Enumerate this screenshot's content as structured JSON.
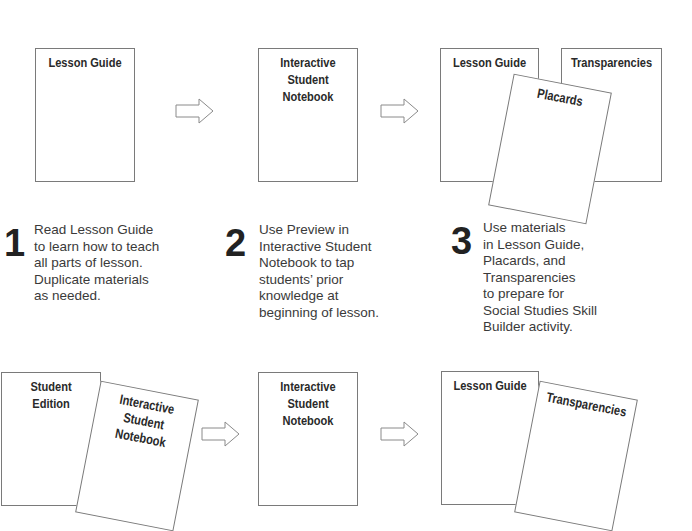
{
  "steps": [
    {
      "number": "1",
      "cards": [
        {
          "title": "Lesson Guide"
        }
      ],
      "text": "Read Lesson Guide\nto learn how to teach\nall parts of lesson.\nDuplicate materials\nas needed."
    },
    {
      "number": "2",
      "cards": [
        {
          "title": "Interactive\nStudent\nNotebook"
        }
      ],
      "text": "Use Preview in\nInteractive Student\nNotebook to tap\nstudents’ prior\nknowledge at\nbeginning of lesson."
    },
    {
      "number": "3",
      "cards": [
        {
          "title": "Lesson Guide"
        },
        {
          "title": "Transparencies"
        },
        {
          "title": "Placards"
        }
      ],
      "text": "Use materials\nin Lesson Guide,\nPlacards, and\nTransparencies\nto prepare for\nSocial Studies Skill\nBuilder activity."
    },
    {
      "cards": [
        {
          "title": "Student\nEdition"
        },
        {
          "title": "Interactive\nStudent\nNotebook"
        }
      ]
    },
    {
      "cards": [
        {
          "title": "Interactive\nStudent\nNotebook"
        }
      ]
    },
    {
      "cards": [
        {
          "title": "Lesson Guide"
        },
        {
          "title": "Transparencies"
        }
      ]
    }
  ],
  "arrows": [
    {
      "from": 1,
      "to": 2
    },
    {
      "from": 2,
      "to": 3
    },
    {
      "from": 4,
      "to": 5
    },
    {
      "from": 5,
      "to": 6
    }
  ],
  "colors": {
    "line": "#7a7a7a",
    "text": "#2a2a2a",
    "background": "#ffffff"
  }
}
